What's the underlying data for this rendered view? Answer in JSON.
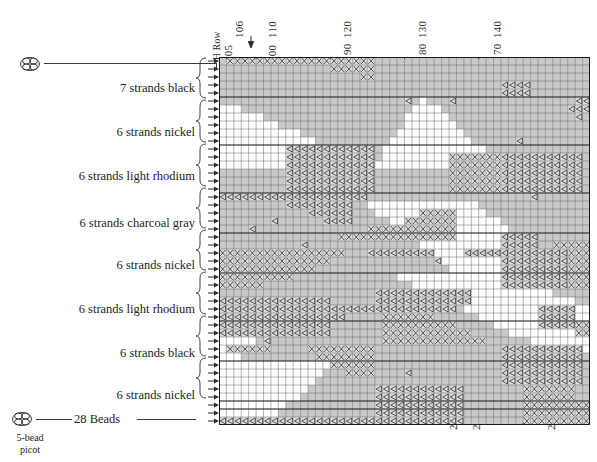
{
  "chart_data": {
    "type": "heatmap",
    "title": "",
    "xlabel": "",
    "ylabel": "",
    "grid": true,
    "legend_position": "left",
    "columns": 50,
    "rows": 46,
    "cell_width": 7.42,
    "cell_height": 8.0,
    "symbols": {
      "filled": "gray shaded cell",
      "empty": "white cell",
      "cross": "X-marked cell",
      "triangle": "triangle-marked cell"
    },
    "top_axis_upper_ticks": [
      {
        "label": "106",
        "col": 1
      },
      {
        "label": "110",
        "col": 5
      },
      {
        "label": "120",
        "col": 15
      },
      {
        "label": "130",
        "col": 25
      },
      {
        "label": "140",
        "col": 35
      }
    ],
    "top_axis_lower_ticks": [
      {
        "label": "105",
        "col": 0
      },
      {
        "label": "100",
        "col": 5
      },
      {
        "label": "90",
        "col": 15
      },
      {
        "label": "80",
        "col": 25
      },
      {
        "label": "70",
        "col": 35
      }
    ],
    "top_axis_annotation": "H Row",
    "bottom_axis_ticks": [
      {
        "label": "292",
        "col": 28
      },
      {
        "label": "290",
        "col": 31
      },
      {
        "label": "280",
        "col": 41
      }
    ],
    "row_groups": [
      {
        "label": "7 strands black",
        "rows": 5
      },
      {
        "label": "6 strands nickel",
        "rows": 6
      },
      {
        "label": "6 strands light rhodium",
        "rows": 6
      },
      {
        "label": "6 strands charcoal gray",
        "rows": 5
      },
      {
        "label": "6 strands nickel",
        "rows": 5
      },
      {
        "label": "6 strands light rhodium",
        "rows": 6
      },
      {
        "label": "6 strands black",
        "rows": 5
      },
      {
        "label": "6 strands nickel",
        "rows": 5
      },
      {
        "label": "28 Beads",
        "rows": 1
      }
    ]
  },
  "top_axis": {
    "annotation": "H Row",
    "upper": [
      "106",
      "110",
      "120",
      "130",
      "140"
    ],
    "lower": [
      "105",
      "100",
      "90",
      "80",
      "70"
    ]
  },
  "bottom_axis": {
    "ticks": [
      "292",
      "290",
      "280"
    ]
  },
  "left_labels": [
    "7 strands black",
    "6 strands nickel",
    "6 strands light rhodium",
    "6 strands charcoal gray",
    "6 strands nickel",
    "6 strands light rhodium",
    "6 strands black",
    "6 strands nickel"
  ],
  "beads": {
    "count_label": "28 Beads"
  },
  "picot": {
    "line1": "5-bead",
    "line2": "picot"
  },
  "colors": {
    "fill_gray": "#c8c8c8",
    "grid_line": "#5a5a5a",
    "ink": "#1d1d1d",
    "white": "#ffffff"
  }
}
